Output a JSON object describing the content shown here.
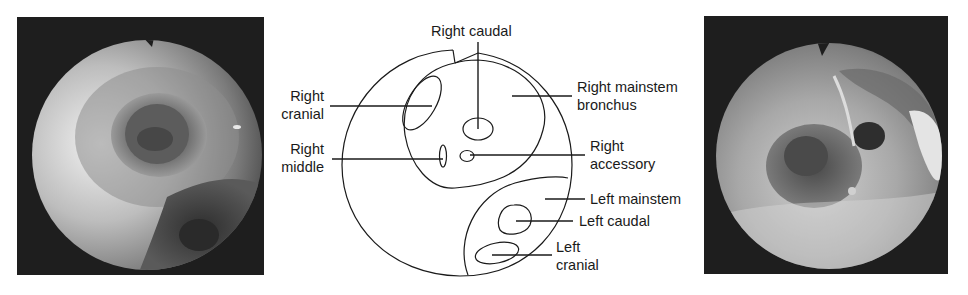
{
  "figure": {
    "panels": [
      {
        "id": "left",
        "kind": "endoscopic-photo",
        "description": "Bronchoscopic view of tracheal bifurcation, grayscale"
      },
      {
        "id": "center",
        "kind": "schematic-diagram"
      },
      {
        "id": "right",
        "kind": "endoscopic-photo",
        "description": "Bronchoscopic view of right mainstem bronchus openings, grayscale"
      }
    ],
    "labels": {
      "right_caudal": {
        "line1": "Right caudal"
      },
      "right_cranial": {
        "line1": "Right",
        "line2": "cranial"
      },
      "right_middle": {
        "line1": "Right",
        "line2": "middle"
      },
      "right_mainstem": {
        "line1": "Right mainstem",
        "line2": "bronchus"
      },
      "right_accessory": {
        "line1": "Right",
        "line2": "accessory"
      },
      "left_mainstem": {
        "line1": "Left mainstem"
      },
      "left_caudal": {
        "line1": "Left caudal"
      },
      "left_cranial": {
        "line1": "Left",
        "line2": "cranial"
      }
    },
    "colors": {
      "line": "#1a1a1a",
      "photo_background": "#1c1c1c",
      "photo_tissue_light": "#e6e6e6",
      "photo_tissue_dark": "#3a3a3a"
    }
  }
}
